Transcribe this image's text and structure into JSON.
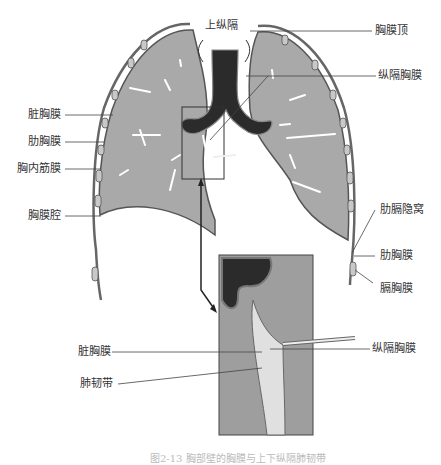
{
  "figure": {
    "caption": "图2-13 胸部壁的胸膜与上下纵隔肺韧带"
  },
  "labels": {
    "superior_mediastinum": "上纵隔",
    "pleural_cupula": "胸膜顶",
    "mediastinal_pleura_top": "纵隔胸膜",
    "visceral_pleura_top": "脏胸膜",
    "costal_pleura_left": "肋胸膜",
    "endothoracic_fascia": "胸内筋膜",
    "pleural_cavity": "胸膜腔",
    "costodiaphragmatic_recess": "肋膈隐窝",
    "costal_pleura_right": "肋胸膜",
    "diaphragmatic_pleura": "膈胸膜",
    "visceral_pleura_inset": "脏胸膜",
    "mediastinal_pleura_inset": "纵隔胸膜",
    "pulmonary_ligament": "肺韧带"
  },
  "colors": {
    "lung_fill": "#a9a9a9",
    "pleura_line": "#555555",
    "trachea_fill": "#2b2b2b",
    "background": "#ffffff"
  }
}
